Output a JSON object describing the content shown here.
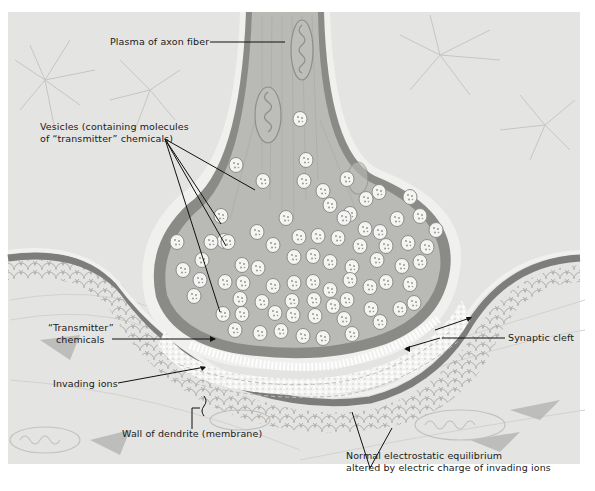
{
  "figure": {
    "colors": {
      "background": "#e4e4e2",
      "axon_plasma": "#b9b9b6",
      "axon_wall_dark": "#8a8a87",
      "axon_wall_light": "#eeeeec",
      "vesicle_fill": "#f4f4f2",
      "vesicle_stroke": "#8c8c8a",
      "cleft": "#f2f2f0",
      "dendrite_wall": "#7d7d7b",
      "scales": "#c9c9c7",
      "label_text": "#1a1a1a",
      "leader_line": "#111111"
    },
    "labels": {
      "plasma": "Plasma of axon fiber",
      "vesicles_line1": "Vesicles (containing molecules",
      "vesicles_line2": "of “transmitter” chemicals)",
      "transmitter_line1": "“Transmitter”",
      "transmitter_line2": "chemicals",
      "invading_ions": "Invading ions",
      "wall_of_dendrite": "Wall of dendrite (membrane)",
      "synaptic_cleft": "Synaptic cleft",
      "equilibrium_line1": "Normal electrostatic equilibrium",
      "equilibrium_line2": "altered by electric charge of invading ions"
    }
  }
}
